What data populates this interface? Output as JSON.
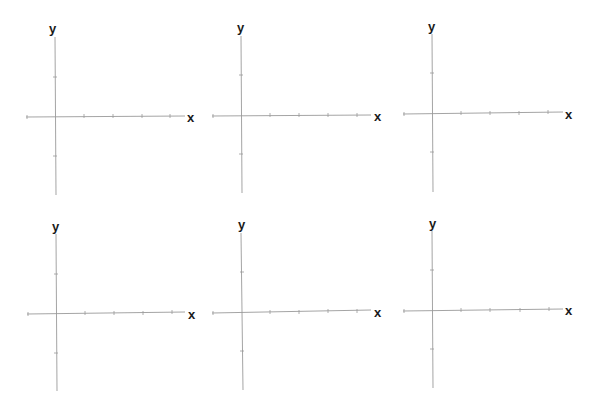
{
  "figure": {
    "panel_count": 6,
    "axis_color": "#9a9a9a",
    "label_color": "#1a1a1a"
  },
  "panels": [
    {
      "x_label": "x",
      "y_label": "y",
      "x_ticks": [
        -1,
        1,
        2,
        3,
        4
      ],
      "y_ticks": [
        2,
        1,
        -1,
        -2
      ]
    },
    {
      "x_label": "x",
      "y_label": "y",
      "x_ticks": [
        -1,
        1,
        2,
        3,
        4
      ],
      "y_ticks": [
        2,
        1,
        -1,
        -2
      ]
    },
    {
      "x_label": "x",
      "y_label": "y",
      "x_ticks": [
        -1,
        1,
        2,
        3,
        4
      ],
      "y_ticks": [
        2,
        1,
        -1,
        -2
      ]
    },
    {
      "x_label": "x",
      "y_label": "y",
      "x_ticks": [
        -1,
        1,
        2,
        3,
        4
      ],
      "y_ticks": [
        2,
        1,
        -1,
        -2
      ]
    },
    {
      "x_label": "x",
      "y_label": "y",
      "x_ticks": [
        -1,
        1,
        2,
        3,
        4
      ],
      "y_ticks": [
        2,
        1,
        -1,
        -2
      ]
    },
    {
      "x_label": "x",
      "y_label": "y",
      "x_ticks": [
        -1,
        1,
        2,
        3,
        4
      ],
      "y_ticks": [
        2,
        1,
        -1,
        -2
      ]
    }
  ]
}
